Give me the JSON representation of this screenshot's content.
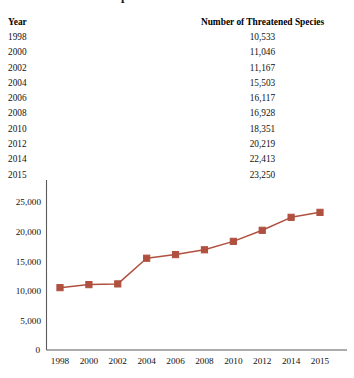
{
  "figure": {
    "title": "Rise in Threatened Species"
  },
  "table": {
    "headers": {
      "year": "Year",
      "count": "Number of Threatened Species"
    },
    "rows": [
      {
        "year": "1998",
        "count": "10,533"
      },
      {
        "year": "2000",
        "count": "11,046"
      },
      {
        "year": "2002",
        "count": "11,167"
      },
      {
        "year": "2004",
        "count": "15,503"
      },
      {
        "year": "2006",
        "count": "16,117"
      },
      {
        "year": "2008",
        "count": "16,928"
      },
      {
        "year": "2010",
        "count": "18,351"
      },
      {
        "year": "2012",
        "count": "20,219"
      },
      {
        "year": "2014",
        "count": "22,413"
      },
      {
        "year": "2015",
        "count": "23,250"
      }
    ]
  },
  "colors": {
    "series": "#b0503f",
    "axis": "#5b5b5b",
    "text": "#111111"
  },
  "chart_data": {
    "type": "line",
    "title": "Rise in Threatened Species",
    "xlabel": "",
    "ylabel": "",
    "categories": [
      "1998",
      "2000",
      "2002",
      "2004",
      "2006",
      "2008",
      "2010",
      "2012",
      "2014",
      "2015"
    ],
    "x": [
      1998,
      2000,
      2002,
      2004,
      2006,
      2008,
      2010,
      2012,
      2014,
      2015
    ],
    "values": [
      10533,
      11046,
      11167,
      15503,
      16117,
      16928,
      18351,
      20219,
      22413,
      23250
    ],
    "series": [
      {
        "name": "Number of Threatened Species",
        "values": [
          10533,
          11046,
          11167,
          15503,
          16117,
          16928,
          18351,
          20219,
          22413,
          23250
        ],
        "color": "#b0503f",
        "marker": "square"
      }
    ],
    "ylim": [
      0,
      26500
    ],
    "yticks": [
      0,
      5000,
      10000,
      15000,
      20000,
      25000
    ],
    "ytick_labels": [
      "0",
      "5,000",
      "10,000",
      "15,000",
      "20,000",
      "25,000"
    ],
    "xtick_labels": [
      "1998",
      "2000",
      "2002",
      "2004",
      "2006",
      "2008",
      "2010",
      "2012",
      "2014",
      "2015"
    ],
    "grid": false,
    "legend": false
  }
}
